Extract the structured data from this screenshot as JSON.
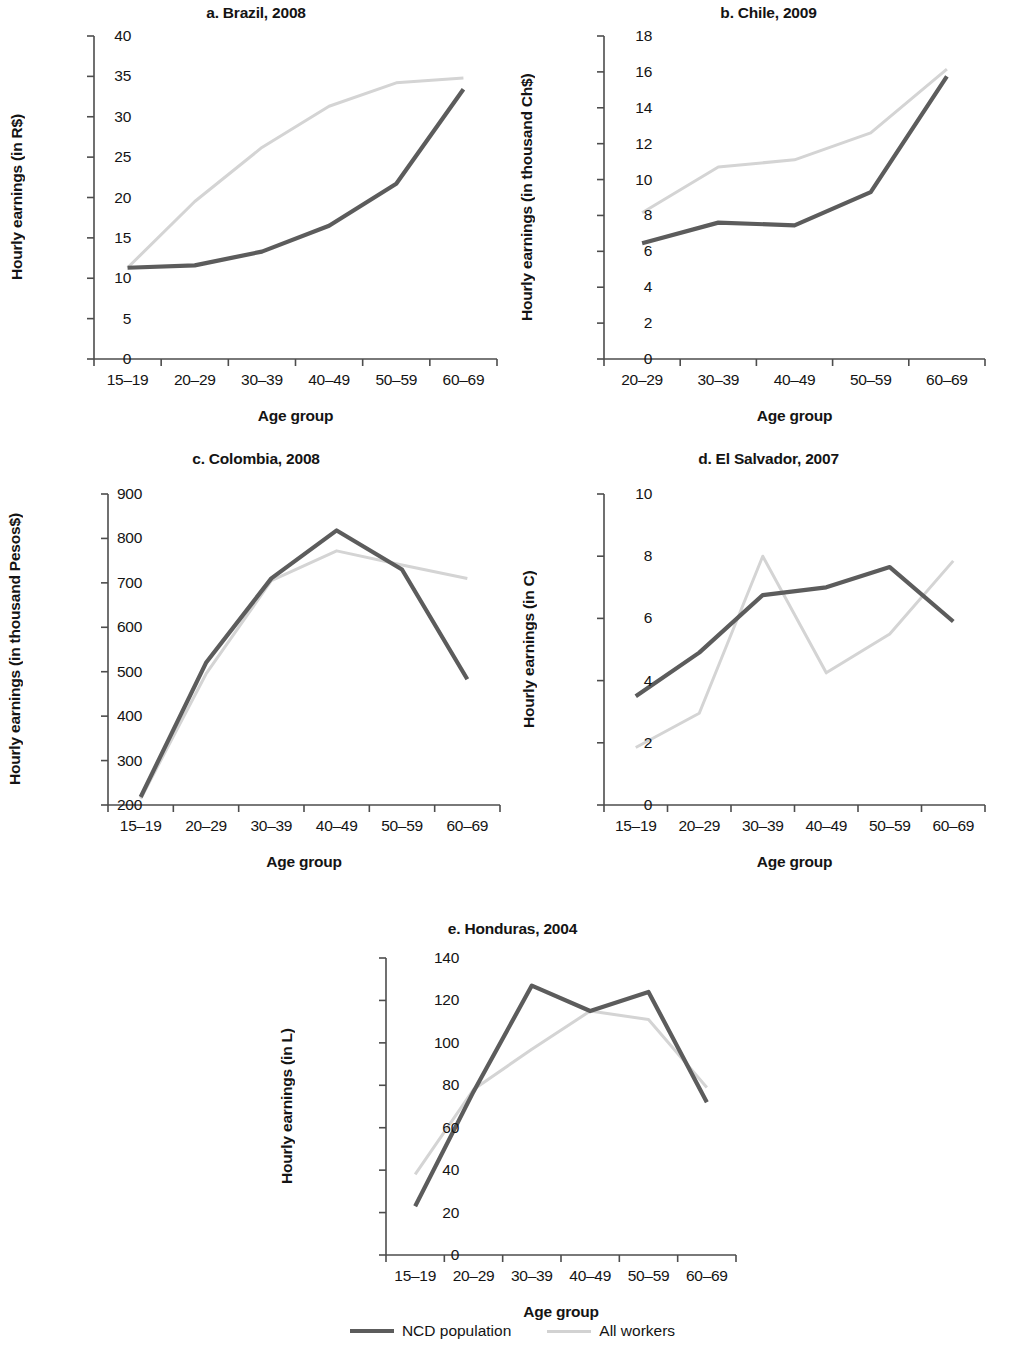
{
  "figure": {
    "series_names": [
      "NCD population",
      "All workers"
    ],
    "colors": {
      "ncd": "#5c5c5c",
      "all": "#d4d4d4",
      "axis": "#4d4d4d",
      "text": "#141414"
    },
    "legend": {
      "ncd_label": "NCD population",
      "all_label": "All workers"
    }
  },
  "chart_data": [
    {
      "id": "a",
      "type": "line",
      "title": "a. Brazil, 2008",
      "xlabel": "Age group",
      "ylabel": "Hourly earnings (in R$)",
      "categories": [
        "15–19",
        "20–29",
        "30–39",
        "40–49",
        "50–59",
        "60–69"
      ],
      "yticks": [
        0,
        5,
        10,
        15,
        20,
        25,
        30,
        35,
        40
      ],
      "ylim": [
        0,
        40
      ],
      "grid": false,
      "legend_position": "figure-bottom",
      "series": [
        {
          "name": "NCD population",
          "values": [
            11.3,
            11.6,
            13.3,
            16.5,
            21.7,
            33.4
          ]
        },
        {
          "name": "All workers",
          "values": [
            11.3,
            19.5,
            26.2,
            31.3,
            34.2,
            34.8
          ]
        }
      ]
    },
    {
      "id": "b",
      "type": "line",
      "title": "b. Chile, 2009",
      "xlabel": "Age group",
      "ylabel": "Hourly earnings (in thousand Ch$)",
      "categories": [
        "20–29",
        "30–39",
        "40–49",
        "50–59",
        "60–69"
      ],
      "yticks": [
        0,
        2,
        4,
        6,
        8,
        10,
        12,
        14,
        16,
        18
      ],
      "ylim": [
        0,
        18
      ],
      "grid": false,
      "legend_position": "figure-bottom",
      "series": [
        {
          "name": "NCD population",
          "values": [
            6.45,
            7.6,
            7.45,
            9.3,
            15.75
          ]
        },
        {
          "name": "All workers",
          "values": [
            8.15,
            10.7,
            11.1,
            12.6,
            16.15
          ]
        }
      ]
    },
    {
      "id": "c",
      "type": "line",
      "title": "c. Colombia, 2008",
      "xlabel": "Age group",
      "ylabel": "Hourly earnings (in thousand Pesos$)",
      "categories": [
        "15–19",
        "20–29",
        "30–39",
        "40–49",
        "50–59",
        "60–69"
      ],
      "yticks": [
        200,
        300,
        400,
        500,
        600,
        700,
        800,
        900
      ],
      "ylim": [
        200,
        900
      ],
      "grid": false,
      "legend_position": "figure-bottom",
      "series": [
        {
          "name": "NCD population",
          "values": [
            218,
            520,
            710,
            818,
            730,
            483
          ]
        },
        {
          "name": "All workers",
          "values": [
            214,
            495,
            705,
            772,
            740,
            710
          ]
        }
      ]
    },
    {
      "id": "d",
      "type": "line",
      "title": "d. El Salvador, 2007",
      "xlabel": "Age group",
      "ylabel": "Hourly earnings (in C)",
      "categories": [
        "15–19",
        "20–29",
        "30–39",
        "40–49",
        "50–59",
        "60–69"
      ],
      "yticks": [
        0,
        2,
        4,
        6,
        8,
        10
      ],
      "ylim": [
        0,
        10
      ],
      "grid": false,
      "legend_position": "figure-bottom",
      "series": [
        {
          "name": "NCD population",
          "values": [
            3.5,
            4.9,
            6.75,
            7.0,
            7.65,
            5.9
          ]
        },
        {
          "name": "All workers",
          "values": [
            1.85,
            2.95,
            8.0,
            4.25,
            5.5,
            7.85
          ]
        }
      ]
    },
    {
      "id": "e",
      "type": "line",
      "title": "e. Honduras, 2004",
      "xlabel": "Age group",
      "ylabel": "Hourly earnings (in L)",
      "categories": [
        "15–19",
        "20–29",
        "30–39",
        "40–49",
        "50–59",
        "60–69"
      ],
      "yticks": [
        0,
        20,
        40,
        60,
        80,
        100,
        120,
        140
      ],
      "ylim": [
        0,
        140
      ],
      "grid": false,
      "legend_position": "figure-bottom",
      "series": [
        {
          "name": "NCD population",
          "values": [
            23,
            77,
            127,
            115,
            124,
            72
          ]
        },
        {
          "name": "All workers",
          "values": [
            38,
            78,
            97,
            115,
            111,
            79
          ]
        }
      ]
    }
  ]
}
